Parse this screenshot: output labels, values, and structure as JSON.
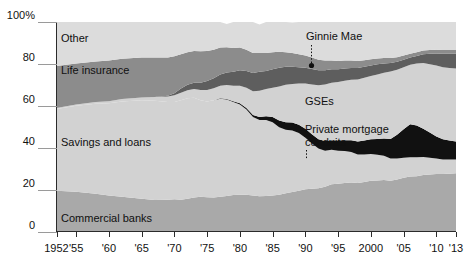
{
  "chart_data": {
    "type": "area",
    "stacked": true,
    "percent": true,
    "title": "",
    "subtitle": "",
    "xlabel": "",
    "ylabel": "",
    "ylim": [
      0,
      100
    ],
    "xlim": [
      1952,
      2013
    ],
    "grid": false,
    "legend_position": "inline-labels",
    "y_ticks": [
      "0",
      "20",
      "40",
      "60",
      "80",
      "100%"
    ],
    "y_tick_values": [
      0,
      20,
      40,
      60,
      80,
      100
    ],
    "x_ticks": [
      "1952",
      "'55",
      "'60",
      "'65",
      "'70",
      "'75",
      "'80",
      "'85",
      "'90",
      "'95",
      "2000",
      "'05",
      "'10",
      "'13"
    ],
    "x_tick_values": [
      1952,
      1955,
      1960,
      1965,
      1970,
      1975,
      1980,
      1985,
      1990,
      1995,
      2000,
      2005,
      2010,
      2013
    ],
    "colors": {
      "commercial_banks": "#a9a9a9",
      "savings_and_loans": "#d2d2d2",
      "private_mortgage_conduits": "#111111",
      "gses": "#d2d2d2",
      "ginnie_mae": "#5e5e5e",
      "life_insurance": "#8c8c8c",
      "other": "#dcdcdc",
      "axis": "#2b2b2b",
      "text": "#101010"
    },
    "x": [
      1952,
      1955,
      1958,
      1960,
      1962,
      1965,
      1967,
      1969,
      1970,
      1971,
      1972,
      1973,
      1974,
      1975,
      1976,
      1977,
      1978,
      1979,
      1980,
      1981,
      1982,
      1983,
      1984,
      1985,
      1986,
      1987,
      1988,
      1989,
      1990,
      1991,
      1992,
      1993,
      1994,
      1995,
      1996,
      1997,
      1998,
      1999,
      2000,
      2001,
      2002,
      2003,
      2004,
      2005,
      2006,
      2007,
      2008,
      2009,
      2010,
      2011,
      2012,
      2013
    ],
    "series": [
      {
        "name": "Commercial banks",
        "label": "Commercial banks",
        "color": "#a9a9a9",
        "values": [
          19.5,
          19.0,
          18.0,
          17.2,
          16.6,
          15.6,
          15.0,
          15.2,
          15.4,
          15.2,
          15.6,
          16.2,
          16.6,
          16.4,
          16.2,
          16.6,
          17.0,
          17.4,
          17.6,
          17.6,
          17.2,
          16.8,
          17.0,
          17.2,
          17.6,
          18.2,
          18.8,
          19.4,
          20.2,
          20.4,
          20.6,
          21.4,
          22.6,
          22.8,
          23.2,
          23.4,
          23.2,
          23.6,
          24.2,
          24.4,
          24.6,
          24.2,
          24.8,
          25.6,
          26.2,
          26.4,
          27.0,
          27.2,
          27.4,
          27.4,
          27.6,
          27.8
        ]
      },
      {
        "name": "Savings and loans",
        "label": "Savings and loans",
        "color": "#d2d2d2",
        "values": [
          39.0,
          41.0,
          43.0,
          44.0,
          45.5,
          47.0,
          47.4,
          46.6,
          46.4,
          47.4,
          48.0,
          47.6,
          46.0,
          45.6,
          46.4,
          46.8,
          46.0,
          44.4,
          43.0,
          40.6,
          37.4,
          36.4,
          36.2,
          35.0,
          32.2,
          30.4,
          29.4,
          27.6,
          24.6,
          21.6,
          19.0,
          17.2,
          16.4,
          15.8,
          15.2,
          14.6,
          13.6,
          13.2,
          12.8,
          12.2,
          11.6,
          10.6,
          10.0,
          9.6,
          9.2,
          9.0,
          8.6,
          8.0,
          7.4,
          7.0,
          6.8,
          6.6
        ]
      },
      {
        "name": "Private mortgage conduits",
        "label": "Private mortgage conduits",
        "color": "#111111",
        "values": [
          0,
          0,
          0,
          0,
          0,
          0,
          0,
          0,
          0,
          0,
          0,
          0,
          0,
          0,
          0,
          0.2,
          0.3,
          0.4,
          0.6,
          0.8,
          1.0,
          1.4,
          1.8,
          2.4,
          3.2,
          3.6,
          3.8,
          4.0,
          4.2,
          4.4,
          4.4,
          4.6,
          4.6,
          4.8,
          5.2,
          5.6,
          6.2,
          6.6,
          7.0,
          7.6,
          8.2,
          9.4,
          11.4,
          13.6,
          15.8,
          15.2,
          13.4,
          12.0,
          10.6,
          9.6,
          9.0,
          8.6
        ]
      },
      {
        "name": "GSEs",
        "label": "GSEs",
        "color": "#d2d2d2",
        "values": [
          0.5,
          0.6,
          0.8,
          1.0,
          1.2,
          1.4,
          1.8,
          2.6,
          3.2,
          3.6,
          3.8,
          4.2,
          5.0,
          5.6,
          5.8,
          6.0,
          6.6,
          7.4,
          8.4,
          9.6,
          11.4,
          12.6,
          13.0,
          14.0,
          16.2,
          17.8,
          18.4,
          19.6,
          21.6,
          23.8,
          25.8,
          27.0,
          27.4,
          28.0,
          28.4,
          28.8,
          29.6,
          30.0,
          30.2,
          30.8,
          31.4,
          32.2,
          31.0,
          29.6,
          28.4,
          29.6,
          31.4,
          32.6,
          33.8,
          34.4,
          34.6,
          34.8
        ]
      },
      {
        "name": "Ginnie Mae",
        "label": "Ginnie Mae",
        "color": "#5e5e5e",
        "values": [
          0,
          0,
          0,
          0,
          0,
          0,
          0,
          0.4,
          1.0,
          2.0,
          2.6,
          3.0,
          3.4,
          4.2,
          4.8,
          5.4,
          6.0,
          6.6,
          7.4,
          8.0,
          8.6,
          9.0,
          8.6,
          8.8,
          9.0,
          8.6,
          8.2,
          7.8,
          7.6,
          7.4,
          7.2,
          6.8,
          6.4,
          6.0,
          5.8,
          5.6,
          5.4,
          5.2,
          5.0,
          4.8,
          4.4,
          4.0,
          3.8,
          3.6,
          3.4,
          3.6,
          4.2,
          5.0,
          5.8,
          6.4,
          6.8,
          7.0
        ]
      },
      {
        "name": "Life insurance",
        "label": "Life insurance",
        "color": "#8c8c8c",
        "values": [
          20.0,
          19.6,
          19.4,
          19.4,
          19.2,
          19.0,
          18.8,
          18.2,
          17.6,
          16.4,
          15.6,
          15.2,
          15.0,
          14.4,
          13.6,
          12.8,
          12.0,
          11.4,
          10.8,
          10.2,
          9.6,
          9.0,
          8.6,
          8.2,
          7.6,
          7.0,
          6.6,
          6.2,
          5.8,
          5.4,
          5.0,
          4.6,
          4.2,
          4.0,
          3.8,
          3.6,
          3.4,
          3.2,
          3.0,
          2.8,
          2.6,
          2.4,
          2.2,
          2.0,
          1.8,
          1.8,
          1.8,
          1.8,
          1.8,
          1.8,
          1.8,
          1.8
        ]
      },
      {
        "name": "Other",
        "label": "Other",
        "color": "#dcdcdc",
        "values": [
          21.0,
          19.8,
          18.8,
          18.4,
          17.5,
          17.0,
          17.0,
          17.0,
          16.4,
          15.4,
          14.4,
          13.8,
          14.0,
          13.8,
          13.2,
          12.2,
          11.1,
          12.4,
          12.2,
          13.2,
          14.8,
          13.6,
          14.8,
          14.4,
          14.2,
          14.4,
          14.6,
          15.4,
          16.0,
          17.0,
          18.0,
          18.4,
          18.4,
          18.6,
          18.4,
          18.4,
          18.6,
          18.2,
          17.8,
          17.4,
          17.2,
          17.2,
          16.8,
          16.0,
          15.2,
          14.4,
          13.6,
          13.4,
          13.2,
          13.4,
          13.4,
          13.4
        ]
      }
    ],
    "annotations": [
      {
        "text": "Ginnie Mae",
        "target_series": "Ginnie Mae",
        "has_leader": true,
        "leader_style": "dotted-with-dot"
      },
      {
        "text": "Private mortgage conduits",
        "target_series": "Private mortgage conduits",
        "has_leader": true,
        "leader_style": "dotted"
      }
    ]
  },
  "labels": {
    "other": "Other",
    "life_insurance": "Life insurance",
    "savings_and_loans": "Savings and loans",
    "commercial_banks": "Commercial banks",
    "ginnie_mae": "Ginnie Mae",
    "gses": "GSEs",
    "private_mortgage_conduits_line1": "Private mortgage",
    "private_mortgage_conduits_line2": "conduits"
  },
  "axis": {
    "y_ticks": [
      {
        "text": "100%",
        "value": 100
      },
      {
        "text": "80",
        "value": 80
      },
      {
        "text": "60",
        "value": 60
      },
      {
        "text": "40",
        "value": 40
      },
      {
        "text": "20",
        "value": 20
      },
      {
        "text": "0",
        "value": 0
      }
    ],
    "x_ticks": [
      {
        "text": "1952",
        "value": 1952
      },
      {
        "text": "'55",
        "value": 1955
      },
      {
        "text": "'60",
        "value": 1960
      },
      {
        "text": "'65",
        "value": 1965
      },
      {
        "text": "'70",
        "value": 1970
      },
      {
        "text": "'75",
        "value": 1975
      },
      {
        "text": "'80",
        "value": 1980
      },
      {
        "text": "'85",
        "value": 1985
      },
      {
        "text": "'90",
        "value": 1990
      },
      {
        "text": "'95",
        "value": 1995
      },
      {
        "text": "2000",
        "value": 2000
      },
      {
        "text": "'05",
        "value": 2005
      },
      {
        "text": "'10",
        "value": 2010
      },
      {
        "text": "'13",
        "value": 2013
      }
    ]
  }
}
